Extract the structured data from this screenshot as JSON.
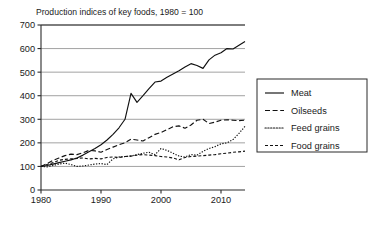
{
  "chart_data": {
    "type": "line",
    "title": "Production indices of key foods, 1980 = 100",
    "xlabel": "",
    "ylabel": "",
    "xlim": [
      1980,
      2014
    ],
    "ylim": [
      0,
      700
    ],
    "ytick_labels": [
      "0",
      "100",
      "200",
      "300",
      "400",
      "500",
      "600",
      "700"
    ],
    "ytick_values": [
      0,
      100,
      200,
      300,
      400,
      500,
      600,
      700
    ],
    "xtick_labels": [
      "1980",
      "1990",
      "2000",
      "2010"
    ],
    "xtick_values": [
      1980,
      1990,
      2000,
      2010
    ],
    "grid": "horizontal",
    "legend_position": "right",
    "x": [
      1980,
      1981,
      1982,
      1983,
      1984,
      1985,
      1986,
      1987,
      1988,
      1989,
      1990,
      1991,
      1992,
      1993,
      1994,
      1995,
      1996,
      1997,
      1998,
      1999,
      2000,
      2001,
      2002,
      2003,
      2004,
      2005,
      2006,
      2007,
      2008,
      2009,
      2010,
      2011,
      2012,
      2013,
      2014
    ],
    "series": [
      {
        "name": "Meat",
        "style": "solid",
        "values": [
          100,
          104,
          110,
          116,
          122,
          128,
          136,
          148,
          162,
          176,
          192,
          212,
          236,
          264,
          300,
          410,
          372,
          400,
          430,
          458,
          462,
          478,
          492,
          506,
          522,
          536,
          528,
          516,
          552,
          572,
          582,
          600,
          598,
          614,
          630
        ]
      },
      {
        "name": "Oilseeds",
        "style": "dashed",
        "values": [
          100,
          112,
          126,
          136,
          146,
          152,
          150,
          158,
          168,
          166,
          160,
          172,
          182,
          192,
          200,
          216,
          212,
          208,
          222,
          236,
          244,
          256,
          268,
          272,
          262,
          276,
          296,
          300,
          282,
          288,
          296,
          298,
          296,
          294,
          296
        ]
      },
      {
        "name": "Feed grains",
        "style": "dotted",
        "values": [
          100,
          98,
          104,
          110,
          114,
          108,
          100,
          102,
          106,
          110,
          112,
          108,
          132,
          140,
          142,
          144,
          150,
          156,
          160,
          150,
          176,
          168,
          156,
          144,
          140,
          150,
          148,
          164,
          176,
          184,
          196,
          200,
          214,
          240,
          270
        ]
      },
      {
        "name": "Food grains",
        "style": "dashdot",
        "values": [
          100,
          108,
          116,
          126,
          130,
          132,
          134,
          136,
          132,
          134,
          132,
          138,
          140,
          138,
          142,
          144,
          148,
          150,
          148,
          146,
          142,
          140,
          136,
          128,
          138,
          142,
          144,
          146,
          148,
          150,
          154,
          156,
          160,
          162,
          165
        ]
      }
    ]
  },
  "legend": {
    "items": [
      {
        "label": "Meat"
      },
      {
        "label": "Oilseeds"
      },
      {
        "label": "Feed grains"
      },
      {
        "label": "Food grains"
      }
    ]
  }
}
